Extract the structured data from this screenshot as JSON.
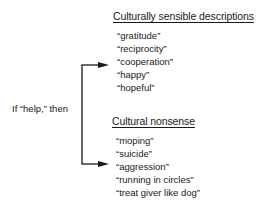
{
  "condition_label": "If “help,” then",
  "branches": [
    {
      "heading": "Culturally sensible descriptions",
      "items": [
        "“gratitude”",
        "“reciprocity”",
        "“cooperation”",
        "“happy”",
        "“hopeful”"
      ]
    },
    {
      "heading": "Cultural nonsense",
      "items": [
        "“moping”",
        "“suicide”",
        "“aggression”",
        "“running in circles”",
        "“treat giver like dog”"
      ]
    }
  ]
}
